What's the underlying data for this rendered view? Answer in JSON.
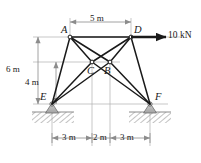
{
  "figure": {
    "colors": {
      "member": "#1a1a1a",
      "dimension_line": "#8c8c8c",
      "ground_hatch": "#a8a8a8",
      "support_fill": "#b5b5b5",
      "node_fill": "#ffffff",
      "label_text": "#1a1a1a"
    },
    "nodes": [
      {
        "id": "A",
        "label": "A",
        "x": 70,
        "y": 37
      },
      {
        "id": "D",
        "label": "D",
        "x": 131,
        "y": 37
      },
      {
        "id": "C",
        "label": "C",
        "x": 92,
        "y": 62
      },
      {
        "id": "B",
        "label": "B",
        "x": 110,
        "y": 62
      },
      {
        "id": "E",
        "label": "E",
        "x": 52,
        "y": 104
      },
      {
        "id": "F",
        "label": "F",
        "x": 150,
        "y": 104
      }
    ],
    "members": [
      {
        "from": "A",
        "to": "D"
      },
      {
        "from": "A",
        "to": "C"
      },
      {
        "from": "A",
        "to": "B"
      },
      {
        "from": "D",
        "to": "C"
      },
      {
        "from": "D",
        "to": "B"
      },
      {
        "from": "A",
        "to": "E"
      },
      {
        "from": "E",
        "to": "C"
      },
      {
        "from": "E",
        "to": "B"
      },
      {
        "from": "C",
        "to": "F"
      },
      {
        "from": "B",
        "to": "F"
      },
      {
        "from": "D",
        "to": "F"
      }
    ],
    "supports": [
      {
        "at": "E",
        "type": "pin"
      },
      {
        "at": "F",
        "type": "pin"
      }
    ],
    "load": {
      "label": "10 kN",
      "applied_at": "D",
      "direction": "horizontal-right"
    },
    "dimensions": {
      "top": {
        "label": "5 m",
        "from": "A",
        "to": "D"
      },
      "left_outer": {
        "label": "6 m"
      },
      "left_inner": {
        "label": "4 m"
      },
      "bottom": [
        {
          "label": "3 m"
        },
        {
          "label": "2 m"
        },
        {
          "label": "3 m"
        }
      ]
    }
  }
}
